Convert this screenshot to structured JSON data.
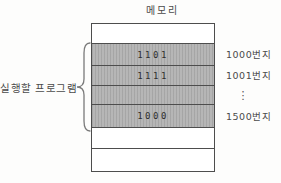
{
  "title": "메모리",
  "left_label": "실행할 프로그램",
  "memory": {
    "rows": [
      {
        "value": "",
        "shaded": false,
        "address": ""
      },
      {
        "value": "1101",
        "shaded": true,
        "address": "1000번지"
      },
      {
        "value": "1111",
        "shaded": true,
        "address": "1001번지"
      },
      {
        "value": "",
        "shaded": true,
        "address": "⋮"
      },
      {
        "value": "1000",
        "shaded": true,
        "address": "1500번지"
      },
      {
        "value": "",
        "shaded": false,
        "address": ""
      },
      {
        "value": "",
        "shaded": false,
        "address": ""
      }
    ]
  },
  "colors": {
    "shaded_fill": "#b6b6b6",
    "border": "#4d4d4d",
    "text": "#3d3d3d",
    "background": "#fdfdfc"
  }
}
